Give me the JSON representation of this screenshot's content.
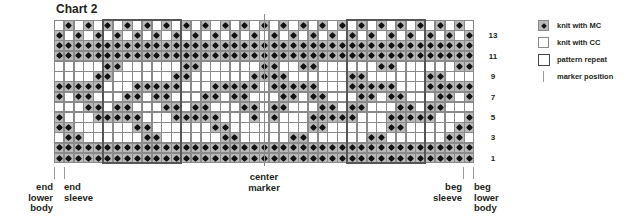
{
  "title": "Chart 2",
  "grid": {
    "columns": 43,
    "rows": 14,
    "legend_key": {
      "d": "knit with MC",
      "w": "knit with CC"
    },
    "rows_top_to_bottom": [
      "wdwdwdwdwdwdwdwdwdwdwdwdwdwdwdwdwdwdwdwdwdw",
      "dwdwdwdwdwdwdwdwdwdwdwdwdwdwdwdwdwdwdwdwdwd",
      "ddddddddddddddddddddddddddddddddddddddddddd",
      "ddddddddddddddddddddddddddddddddddddddddddd",
      "wwwwwddwwwwwwddwwwwwwddwwddwwwwwwddwwwwwwdd",
      "wwwwddwwwwwwddwwwwwwddddwwwwwwddwwwwwwddwww",
      "dddddwwwdddddwwwdddddwdddddwwwdddddwwwddddd",
      "dwddwwwddwddwwwddwddwwwddwddwwwddwddwwwddwd",
      "wwwddwddwwwddwddwwwddwddwwwddwddwwwddwddwww",
      "dwwwdddddwwwdddddwwwdwdwwwdddddwwwdddddwwwd",
      "ddwwwwwwddwwwwwwddwwwwwwwwddwwwwwwddwwwwwdd",
      "wddwwwwwwddwwwwwwddwwwwwddwwwwwwddwwwwwwddw",
      "ddddddddddddddddddddddddddddddddddddddddddd",
      "ddddddddddddddddddddddddddddddddddddddddddd"
    ],
    "pattern_repeats": [
      {
        "start_col": 5,
        "end_col": 12
      },
      {
        "start_col": 30,
        "end_col": 37
      }
    ],
    "center_marker_col": 21
  },
  "row_numbers": [
    "13",
    "11",
    "9",
    "7",
    "5",
    "3",
    "1"
  ],
  "legend": [
    {
      "swatch": "mc",
      "label": "knit with MC"
    },
    {
      "swatch": "cc",
      "label": "knit with CC"
    },
    {
      "swatch": "rep",
      "label": "pattern repeat"
    },
    {
      "swatch": "mark",
      "label": "marker position"
    }
  ],
  "bottom_labels": {
    "end_lower_body": "end\nlower\nbody",
    "end_sleeve": "end\nsleeve",
    "center_marker": "center\nmarker",
    "beg_sleeve": "beg\nsleeve",
    "beg_lower_body": "beg\nlower\nbody"
  },
  "colors": {
    "mc_fill": "#b9b9b9",
    "dot": "#111111",
    "grid_line": "#8a8a8a",
    "repeat_border": "#555555",
    "text": "#231f20"
  }
}
